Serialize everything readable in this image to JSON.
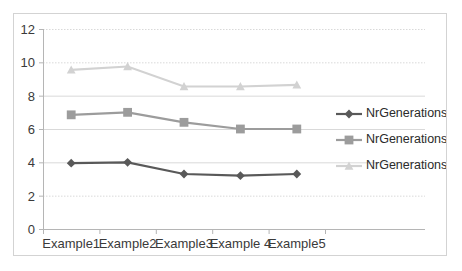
{
  "chart_data": {
    "type": "line",
    "title": "",
    "xlabel": "",
    "ylabel": "",
    "categories": [
      "Example1",
      "Example2",
      "Example3",
      "Example 4",
      "Example5"
    ],
    "ylim": [
      0,
      12
    ],
    "yticks": [
      0,
      2,
      4,
      6,
      8,
      10,
      12
    ],
    "grid": true,
    "grid_axis": "y",
    "legend_position": "right",
    "series": [
      {
        "name": "NrGenerations1",
        "values": [
          3.95,
          4.0,
          3.3,
          3.2,
          3.3
        ],
        "color": "#595959",
        "marker": "diamond"
      },
      {
        "name": "NrGenerations2",
        "values": [
          6.85,
          7.0,
          6.4,
          6.0,
          6.0
        ],
        "color": "#9c9c9c",
        "marker": "square"
      },
      {
        "name": "NrGenerations3",
        "values": [
          9.55,
          9.75,
          8.55,
          8.55,
          8.65
        ],
        "color": "#d2d2d2",
        "marker": "triangle"
      }
    ]
  },
  "axis": {
    "y_tick_labels": [
      "12",
      "10",
      "8",
      "6",
      "4",
      "2",
      "0"
    ],
    "x_tick_labels": [
      "Example1",
      "Example2",
      "Example3",
      "Example 4",
      "Example5"
    ]
  },
  "legend": {
    "entries": [
      {
        "label": "NrGenerations1"
      },
      {
        "label": "NrGenerations2"
      },
      {
        "label": "NrGenerations3"
      }
    ]
  },
  "colors": {
    "series1": "#595959",
    "series2": "#9c9c9c",
    "series3": "#d2d2d2",
    "grid": "#d9d9d9",
    "axis": "#b5b5b5",
    "border": "#d3d3d3",
    "background": "#ffffff"
  }
}
